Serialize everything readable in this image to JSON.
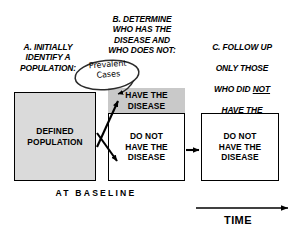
{
  "diagram": {
    "colors": {
      "stroke": "#000000",
      "background": "#ffffff",
      "population_fill": "#dadada",
      "disease_fill": "#c9c9c9",
      "text": "#000000"
    },
    "captions": [
      {
        "key": "a",
        "text": "A. INITIALLY\nIDENTIFY A\nPOPULATION:"
      },
      {
        "key": "b",
        "text": "B. DETERMINE\nWHO HAS THE\nDISEASE AND\nWHO DOES NOT:"
      },
      {
        "key": "c",
        "line1": "C. FOLLOW UP",
        "line2": "ONLY THOSE",
        "line3_prefix": "WHO DID ",
        "line3_emphasis": "NOT",
        "line4": "HAVE THE",
        "line5": "DISEASE AT",
        "line6": "BASELINE:"
      }
    ],
    "boxes": {
      "population": "DEFINED\nPOPULATION",
      "have_disease": "HAVE THE\nDISEASE",
      "no_disease_baseline": "DO NOT\nHAVE THE\nDISEASE",
      "no_disease_followup": "DO NOT\nHAVE THE\nDISEASE"
    },
    "callout": {
      "text": "Prevalent\nCases"
    },
    "axis_labels": {
      "baseline": "AT BASELINE",
      "time": "TIME"
    }
  }
}
